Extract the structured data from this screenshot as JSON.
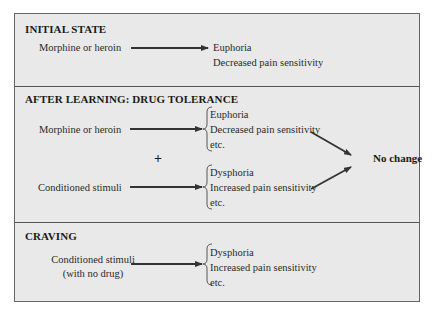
{
  "sections": [
    {
      "title": "INITIAL STATE",
      "stimulus": "Morphine or heroin",
      "effects": [
        "Euphoria",
        "Decreased pain sensitivity"
      ]
    },
    {
      "title": "AFTER LEARNING: DRUG TOLERANCE",
      "drug": {
        "stimulus": "Morphine or heroin",
        "effects": [
          "Euphoria",
          "Decreased pain sensitivity",
          "etc."
        ]
      },
      "plus": "+",
      "conditioned": {
        "stimulus": "Conditioned stimuli",
        "effects": [
          "Dysphoria",
          "Increased pain sensitivity",
          "etc."
        ]
      },
      "outcome": "No change"
    },
    {
      "title": "CRAVING",
      "stimulus_line1": "Conditioned stimuli",
      "stimulus_line2": "(with no drug)",
      "effects": [
        "Dysphoria",
        "Increased pain sensitivity",
        "etc."
      ]
    }
  ],
  "colors": {
    "panel_bg": "#e9e9e9",
    "border": "#666666",
    "arrow": "#333333"
  }
}
